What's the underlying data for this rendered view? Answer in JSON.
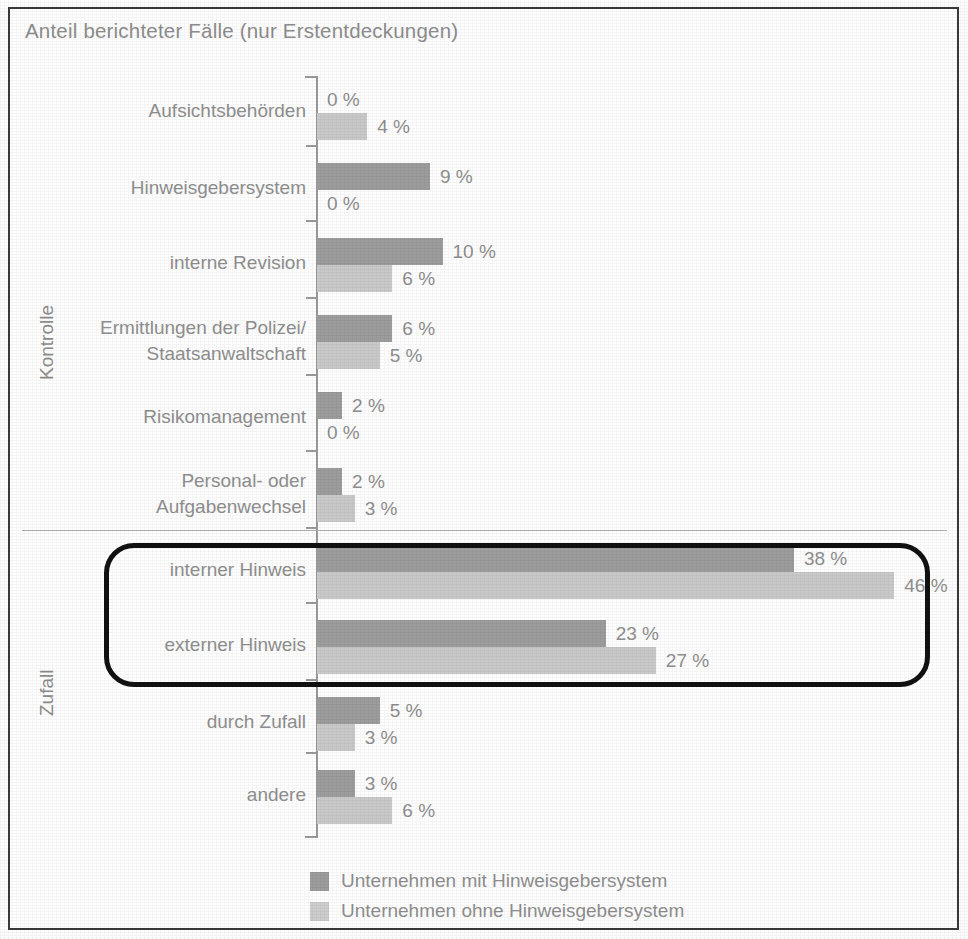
{
  "chart_data": {
    "type": "bar",
    "orientation": "horizontal",
    "title": "Anteil berichteter Fälle (nur Erstentdeckungen)",
    "xlabel": "",
    "ylabel": "",
    "xlim": [
      0,
      50
    ],
    "grid": false,
    "legend_position": "bottom",
    "value_suffix": "%",
    "groups": [
      {
        "name": "Kontrolle",
        "categories": [
          "Aufsichtsbehörden",
          "Hinweisgebersystem",
          "interne Revision",
          "Ermittlungen der Polizei/\nStaatsanwaltschaft",
          "Risikomanagement",
          "Personal- oder\nAufgabenwechsel"
        ]
      },
      {
        "name": "Zufall",
        "categories": [
          "interner Hinweis",
          "externer Hinweis",
          "durch Zufall",
          "andere"
        ]
      }
    ],
    "categories": [
      "Aufsichtsbehörden",
      "Hinweisgebersystem",
      "interne Revision",
      "Ermittlungen der Polizei/Staatsanwaltschaft",
      "Risikomanagement",
      "Personal- oder Aufgabenwechsel",
      "interner Hinweis",
      "externer Hinweis",
      "durch Zufall",
      "andere"
    ],
    "series": [
      {
        "name": "Unternehmen mit Hinweisgebersystem",
        "color": "#9d9d9d",
        "values": [
          0,
          9,
          10,
          6,
          2,
          2,
          38,
          23,
          5,
          3
        ]
      },
      {
        "name": "Unternehmen ohne Hinweisgebersystem",
        "color": "#c9c9c9",
        "values": [
          4,
          0,
          6,
          5,
          0,
          3,
          46,
          27,
          3,
          6
        ]
      }
    ],
    "highlight": {
      "categories": [
        "interner Hinweis",
        "externer Hinweis"
      ],
      "style": "black-rounded-rectangle"
    }
  },
  "title": "Anteil berichteter Fälle (nur Erstentdeckungen)",
  "group_labels": {
    "kontrolle": "Kontrolle",
    "zufall": "Zufall"
  },
  "rows": [
    {
      "label_line1": "Aufsichtsbehörden",
      "label_line2": "",
      "with_label": "0 %",
      "without_label": "4 %",
      "with_value": 0,
      "without_value": 4
    },
    {
      "label_line1": "Hinweisgebersystem",
      "label_line2": "",
      "with_label": "9 %",
      "without_label": "0 %",
      "with_value": 9,
      "without_value": 0
    },
    {
      "label_line1": "interne Revision",
      "label_line2": "",
      "with_label": "10 %",
      "without_label": "6 %",
      "with_value": 10,
      "without_value": 6
    },
    {
      "label_line1": "Ermittlungen der Polizei/",
      "label_line2": "Staatsanwaltschaft",
      "with_label": "6 %",
      "without_label": "5 %",
      "with_value": 6,
      "without_value": 5
    },
    {
      "label_line1": "Risikomanagement",
      "label_line2": "",
      "with_label": "2 %",
      "without_label": "0 %",
      "with_value": 2,
      "without_value": 0
    },
    {
      "label_line1": "Personal- oder",
      "label_line2": "Aufgabenwechsel",
      "with_label": "2 %",
      "without_label": "3 %",
      "with_value": 2,
      "without_value": 3
    },
    {
      "label_line1": "interner Hinweis",
      "label_line2": "",
      "with_label": "38 %",
      "without_label": "46 %",
      "with_value": 38,
      "without_value": 46
    },
    {
      "label_line1": "externer Hinweis",
      "label_line2": "",
      "with_label": "23 %",
      "without_label": "27 %",
      "with_value": 23,
      "without_value": 27
    },
    {
      "label_line1": "durch Zufall",
      "label_line2": "",
      "with_label": "5 %",
      "without_label": "3 %",
      "with_value": 5,
      "without_value": 3
    },
    {
      "label_line1": "andere",
      "label_line2": "",
      "with_label": "3 %",
      "without_label": "6 %",
      "with_value": 3,
      "without_value": 6
    }
  ],
  "legend": {
    "items": [
      {
        "label": "Unternehmen mit Hinweisgebersystem",
        "color": "#9d9d9d"
      },
      {
        "label": "Unternehmen ohne Hinweisgebersystem",
        "color": "#cdcdcd"
      }
    ]
  }
}
